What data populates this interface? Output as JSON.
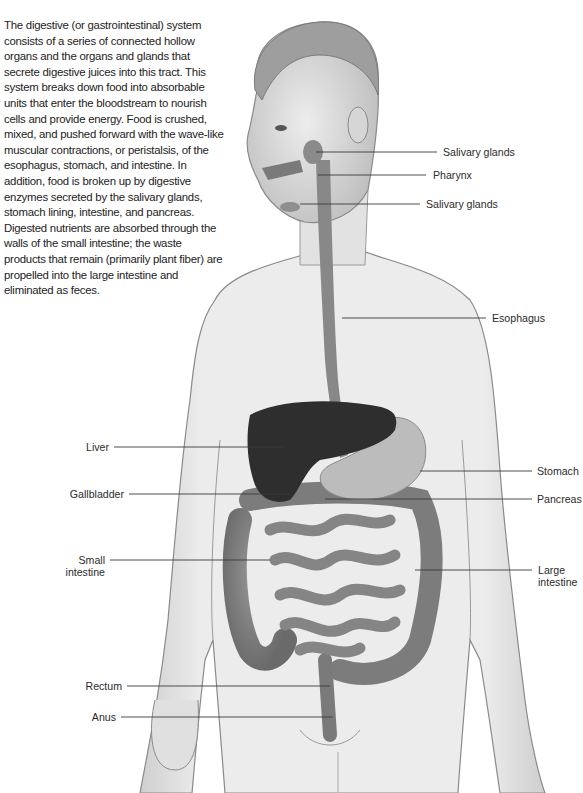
{
  "intro_text": "The digestive (or gastrointestinal) system consists of a series of connected hollow organs and the organs and glands that secrete digestive juices into this tract. This system breaks down food into absorbable units that enter the bloodstream to nourish cells and provide energy. Food is crushed, mixed, and pushed forward with the wave-like muscular contractions, or peristalsis, of the esophagus, stomach, and intestine. In addition, food is broken up by digestive enzymes secreted by the salivary glands, stomach lining, intestine, and pancreas. Digested nutrients are absorbed through the walls of the small intestine; the waste products that remain (primarily plant fiber) are propelled into the large intestine and eliminated as feces.",
  "labels": {
    "right": [
      {
        "id": "salivary-glands-upper",
        "text": "Salivary glands"
      },
      {
        "id": "pharynx",
        "text": "Pharynx"
      },
      {
        "id": "salivary-glands-lower",
        "text": "Salivary glands"
      },
      {
        "id": "esophagus",
        "text": "Esophagus"
      },
      {
        "id": "stomach",
        "text": "Stomach"
      },
      {
        "id": "pancreas",
        "text": "Pancreas"
      },
      {
        "id": "large-intestine",
        "line1": "Large",
        "line2": "intestine"
      }
    ],
    "left": [
      {
        "id": "liver",
        "text": "Liver"
      },
      {
        "id": "gallbladder",
        "text": "Gallbladder"
      },
      {
        "id": "small-intestine",
        "line1": "Small",
        "line2": "intestine"
      },
      {
        "id": "rectum",
        "text": "Rectum"
      },
      {
        "id": "anus",
        "text": "Anus"
      }
    ]
  },
  "colors": {
    "skin": "#e4e4e4",
    "skin_outline": "#8a8a8a",
    "organ": "#7d7d7d",
    "liver": "#2f2f2f",
    "stomach": "#bdbdbd",
    "leader_line": "#3a3a3a"
  }
}
